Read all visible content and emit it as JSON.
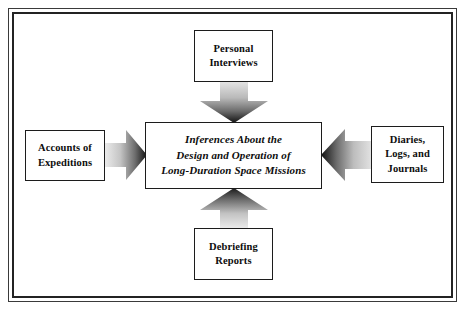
{
  "diagram": {
    "background_color": "#ffffff",
    "frame": {
      "outer_border_color": "#3a3a3a",
      "inner_border_color": "#232323"
    },
    "center_node": {
      "id": "center",
      "label": "Inferences About the\nDesign and Operation of\nLong-Duration Space Missions",
      "style": "bold-italic",
      "border_color": "#1c1c1c",
      "fill_color": "#ffffff"
    },
    "source_nodes": [
      {
        "id": "top",
        "label": "Personal\nInterviews",
        "position": "top",
        "border_color": "#1c1c1c",
        "fill_color": "#ffffff"
      },
      {
        "id": "left",
        "label": "Accounts of\nExpeditions",
        "position": "left",
        "border_color": "#1c1c1c",
        "fill_color": "#ffffff"
      },
      {
        "id": "right",
        "label": "Diaries,\nLogs, and\nJournals",
        "position": "right",
        "border_color": "#1c1c1c",
        "fill_color": "#ffffff"
      },
      {
        "id": "bottom",
        "label": "Debriefing\nReports",
        "position": "bottom",
        "border_color": "#1c1c1c",
        "fill_color": "#ffffff"
      }
    ],
    "arrows": [
      {
        "id": "top-to-center",
        "from": "top",
        "to": "center",
        "direction": "down",
        "style": "block-arrow-gradient",
        "gradient_from": "#e6e6e6",
        "gradient_to": "#111111"
      },
      {
        "id": "left-to-center",
        "from": "left",
        "to": "center",
        "direction": "right",
        "style": "block-arrow-gradient",
        "gradient_from": "#ededed",
        "gradient_to": "#111111"
      },
      {
        "id": "right-to-center",
        "from": "right",
        "to": "center",
        "direction": "left",
        "style": "block-arrow-gradient",
        "gradient_from": "#e3e3e3",
        "gradient_to": "#111111"
      },
      {
        "id": "bottom-to-center",
        "from": "bottom",
        "to": "center",
        "direction": "up",
        "style": "block-arrow-gradient",
        "gradient_from": "#ededed",
        "gradient_to": "#1a1a1a"
      }
    ]
  }
}
